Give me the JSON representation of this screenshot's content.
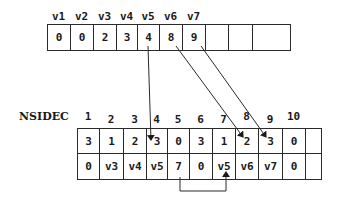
{
  "top_array": {
    "headers": [
      "v1",
      "v2",
      "v3",
      "v4",
      "v5",
      "v6",
      "v7",
      "",
      "",
      ""
    ],
    "cells": [
      "0",
      "0",
      "2",
      "3",
      "4",
      "8",
      "9",
      "",
      "",
      ""
    ]
  },
  "bottom_array": {
    "label": "NSIDEC",
    "indices": [
      "1",
      "2",
      "3",
      "4",
      "5",
      "6",
      "7",
      "8",
      "9",
      "10",
      ""
    ],
    "row1": [
      "3",
      "1",
      "2",
      "3",
      "0",
      "3",
      "1",
      "2",
      "3",
      "0",
      ""
    ],
    "row2": [
      "0",
      "v3",
      "v4",
      "v5",
      "7",
      "0",
      "v5",
      "v6",
      "v7",
      "0",
      ""
    ]
  },
  "arrows": [
    {
      "from": "top v5 (4)",
      "to": "bottom index 4"
    },
    {
      "from": "top v6 (8)",
      "to": "bottom index 8"
    },
    {
      "from": "top v7 (9)",
      "to": "bottom index 9"
    },
    {
      "from": "bottom row2 index 5 (7)",
      "to": "bottom row2 index 7"
    }
  ],
  "colors": {
    "line": "#2a2a2a",
    "background": "#ffffff"
  }
}
